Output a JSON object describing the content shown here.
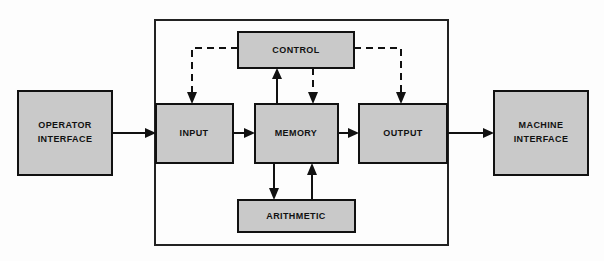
{
  "diagram": {
    "colors": {
      "block_fill": "#c9c9c9",
      "block_stroke": "#111111",
      "line": "#111111",
      "background": "#fdfdfd",
      "outer_border": "#222222"
    },
    "outer_container": {
      "name": "computer-boundary",
      "x": 155,
      "y": 20,
      "width": 293,
      "height": 225
    },
    "blocks": [
      {
        "id": "operator-interface",
        "label": "OPERATOR\nINTERFACE",
        "line1": "OPERATOR",
        "line2": "INTERFACE",
        "x": 18,
        "y": 91,
        "width": 94,
        "height": 84,
        "inside_container": false
      },
      {
        "id": "control",
        "label": "CONTROL",
        "line1": "CONTROL",
        "line2": "",
        "x": 238,
        "y": 32,
        "width": 116,
        "height": 36,
        "inside_container": true
      },
      {
        "id": "input",
        "label": "INPUT",
        "line1": "INPUT",
        "line2": "",
        "x": 156,
        "y": 104,
        "width": 77,
        "height": 59,
        "inside_container": true
      },
      {
        "id": "memory",
        "label": "MEMORY",
        "line1": "MEMORY",
        "line2": "",
        "x": 255,
        "y": 104,
        "width": 83,
        "height": 59,
        "inside_container": true
      },
      {
        "id": "output",
        "label": "OUTPUT",
        "line1": "OUTPUT",
        "line2": "",
        "x": 359,
        "y": 104,
        "width": 88,
        "height": 59,
        "inside_container": true
      },
      {
        "id": "arithmetic",
        "label": "ARITHMETIC",
        "line1": "ARITHMETIC",
        "line2": "",
        "x": 238,
        "y": 200,
        "width": 117,
        "height": 32,
        "inside_container": true
      },
      {
        "id": "machine-interface",
        "label": "MACHINE\nINTERFACE",
        "line1": "MACHINE",
        "line2": "INTERFACE",
        "x": 494,
        "y": 91,
        "width": 94,
        "height": 84,
        "inside_container": false
      }
    ],
    "connections": [
      {
        "id": "operator-to-input",
        "from": "operator-interface",
        "to": "input",
        "style": "solid",
        "label": ""
      },
      {
        "id": "input-to-memory",
        "from": "input",
        "to": "memory",
        "style": "solid",
        "label": ""
      },
      {
        "id": "memory-to-output",
        "from": "memory",
        "to": "output",
        "style": "solid",
        "label": ""
      },
      {
        "id": "output-to-machine",
        "from": "output",
        "to": "machine-interface",
        "style": "solid",
        "label": ""
      },
      {
        "id": "control-to-input",
        "from": "control",
        "to": "input",
        "style": "dashed",
        "label": ""
      },
      {
        "id": "control-to-memory",
        "from": "control",
        "to": "memory",
        "style": "dashed",
        "label": ""
      },
      {
        "id": "control-to-output",
        "from": "control",
        "to": "output",
        "style": "dashed",
        "label": ""
      },
      {
        "id": "memory-to-control",
        "from": "memory",
        "to": "control",
        "style": "solid",
        "label": ""
      },
      {
        "id": "memory-to-arithmetic",
        "from": "memory",
        "to": "arithmetic",
        "style": "solid",
        "label": ""
      },
      {
        "id": "arithmetic-to-memory",
        "from": "arithmetic",
        "to": "memory",
        "style": "solid",
        "label": ""
      }
    ],
    "legend": {
      "solid_meaning": "data flow",
      "dashed_meaning": "control signal"
    }
  }
}
